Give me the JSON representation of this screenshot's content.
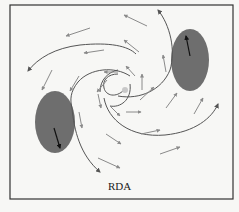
{
  "diagram": {
    "label": "RDA",
    "colors": {
      "background": "#f7f7f5",
      "frame": "#333333",
      "ellipse_fill": "#6e6e6e",
      "ellipse_arrow": "#111111",
      "streamline": "#555555",
      "vector": "#8a8a8a",
      "center_dot": "#c8c8c8"
    },
    "ellipses": [
      {
        "name": "left-vortex",
        "cx": 55,
        "cy": 122,
        "rx": 20,
        "ry": 31,
        "arrow": "down"
      },
      {
        "name": "right-vortex",
        "cx": 190,
        "cy": 60,
        "rx": 19,
        "ry": 31,
        "arrow": "up"
      }
    ]
  }
}
